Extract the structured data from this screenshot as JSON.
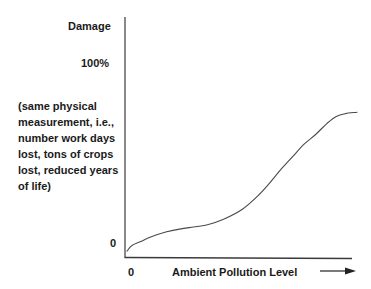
{
  "chart_data": {
    "type": "line",
    "title": "",
    "xlabel": "Ambient Pollution Level",
    "ylabel": "Damage",
    "y_note": "(same physical measurement, i.e., number work days lost, tons of crops lost, reduced years of life)",
    "y_tick_labels": [
      "0",
      "100%"
    ],
    "x_tick_labels": [
      "0"
    ],
    "x_arrow": true,
    "grid": false,
    "legend": null,
    "xlim": [
      0,
      100
    ],
    "ylim": [
      0,
      100
    ],
    "series": [
      {
        "name": "Damage function",
        "x": [
          0,
          2,
          6,
          10,
          15,
          20,
          27,
          35,
          42,
          50,
          57,
          62,
          67,
          72,
          77,
          82,
          87,
          91,
          95,
          100
        ],
        "y": [
          2,
          6,
          9,
          12,
          15,
          17,
          19,
          21,
          25,
          32,
          42,
          51,
          61,
          70,
          79,
          86,
          94,
          99,
          101,
          102
        ]
      }
    ],
    "annotations": [
      {
        "text": "100%",
        "position": "y-axis upper tick label"
      },
      {
        "text": "0",
        "position": "origin (both axes)"
      }
    ]
  },
  "labels": {
    "y_title": "Damage",
    "y_max": "100%",
    "y_note": "(same physical measurement, i.e., number work days lost, tons of crops lost, reduced years of life)",
    "y_zero": "0",
    "x_zero": "0",
    "x_title": "Ambient Pollution Level"
  },
  "colors": {
    "axis": "#3a3a3a",
    "curve": "#4a4a4a",
    "text": "#1a1a1a"
  }
}
